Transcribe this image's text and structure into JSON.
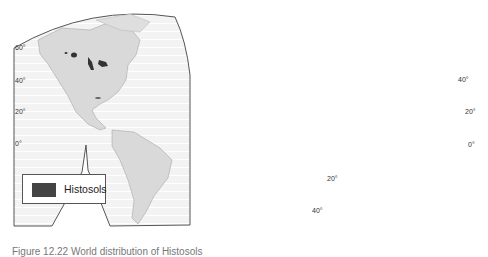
{
  "figure": {
    "caption": "Figure 12.22 World distribution of Histosols",
    "colors": {
      "ocean": "#f4f4f4",
      "land": "#d9d9d9",
      "coast": "#9a9a9a",
      "frame": "#555555",
      "histosols": "#333333",
      "graticule": "#ffffff"
    }
  },
  "legend": {
    "items": [
      {
        "label": "Histosols",
        "color": "#444444"
      }
    ]
  },
  "latitude_labels": {
    "americas": [
      "60°",
      "40°",
      "20°",
      "0°"
    ],
    "eurasia_right": [
      "40°",
      "20°",
      "0°"
    ],
    "africa_south": [
      "20°",
      "40°"
    ]
  },
  "panels": [
    "Americas",
    "Europe-Africa-Asia",
    "Australia-New Zealand inset"
  ]
}
